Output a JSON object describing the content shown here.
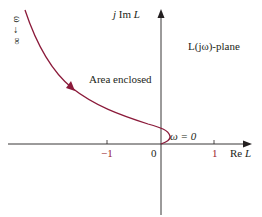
{
  "diagram": {
    "type": "nyquist-plot",
    "plane_label": "L(jω)-plane",
    "axes": {
      "imag_label_prefix": "j Im ",
      "imag_label_var": "L",
      "real_label_prefix": "Re ",
      "real_label_var": "L"
    },
    "ticks": {
      "neg_one": "−1",
      "zero": "0",
      "pos_one": "1"
    },
    "annotations": {
      "area": "Area enclosed",
      "omega_zero": "ω = 0",
      "omega_inf": "ω → ∞"
    },
    "colors": {
      "curve": "#8b1a3a",
      "axes": "#231f20",
      "tick_labels": "#9b1b30"
    }
  }
}
